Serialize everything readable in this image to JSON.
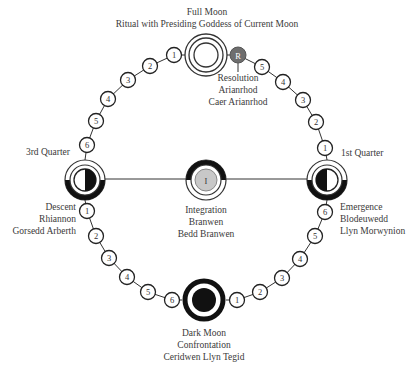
{
  "full_moon": {
    "title": "Full Moon",
    "subtitle": "Ritual with Presiding Goddess of Current Moon"
  },
  "resolution": {
    "symbol": "R",
    "lines": [
      "Resolution",
      "Arianrhod",
      "Caer Arianrhod"
    ]
  },
  "third_quarter": {
    "title": "3rd Quarter",
    "lines": [
      "Descent",
      "Rhiannon",
      "Gorsedd Arberth"
    ]
  },
  "first_quarter": {
    "title": "1st Quarter",
    "lines": [
      "Emergence",
      "Blodeuwedd",
      "Llyn Morwynion"
    ]
  },
  "integration": {
    "symbol": "I",
    "lines": [
      "Integration",
      "Branwen",
      "Bedd Branwen"
    ]
  },
  "dark_moon": {
    "lines": [
      "Dark Moon",
      "Confrontation",
      "Ceridwen Llyn Tegid"
    ]
  },
  "steps": {
    "top_left": [
      "1",
      "2",
      "3",
      "4",
      "5",
      "6"
    ],
    "top_right": [
      "5",
      "4",
      "3",
      "2",
      "1"
    ],
    "bottom_left": [
      "1",
      "2",
      "3",
      "4",
      "5",
      "6"
    ],
    "bottom_right": [
      "6",
      "5",
      "4",
      "3",
      "2",
      "1"
    ]
  },
  "colors": {
    "stroke": "#222222",
    "resolution_fill": "#6e6e6e",
    "integration_fill": "#c8c8c8"
  }
}
